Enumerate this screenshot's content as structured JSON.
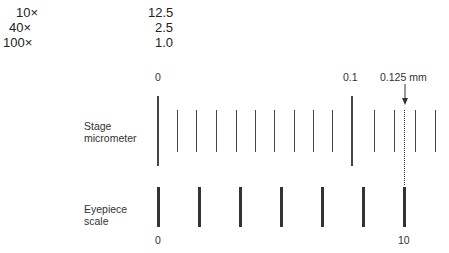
{
  "table": {
    "rows": [
      {
        "objective": "10×",
        "value": "12.5"
      },
      {
        "objective": "40×",
        "value": "2.5"
      },
      {
        "objective": "100×",
        "value": "1.0"
      }
    ]
  },
  "diagram": {
    "stage_label_line1": "Stage",
    "stage_label_line2": "micrometer",
    "eyepiece_label_line1": "Eyepiece",
    "eyepiece_label_line2": "scale",
    "stage_zero": "0",
    "stage_point_one": "0.1",
    "measurement_label": "0.125 mm",
    "eyepiece_zero": "0",
    "eyepiece_ten": "10",
    "stage_lines_x": [
      158,
      177,
      196,
      216,
      236,
      255,
      274,
      294,
      313,
      332,
      352,
      374,
      394,
      415,
      435
    ],
    "stage_long_lines_x": [
      158,
      352
    ],
    "eyepiece_lines_x": [
      158,
      199,
      240,
      281,
      322,
      363,
      404
    ],
    "dotted_line_x": 405
  }
}
